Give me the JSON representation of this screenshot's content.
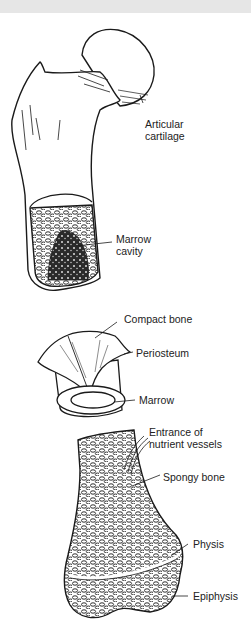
{
  "figure": {
    "sections": [
      {
        "id": "femur-head",
        "labels": [
          {
            "text": "Articular\ncartilage"
          },
          {
            "text": "Marrow\ncavity"
          }
        ]
      },
      {
        "id": "shaft-section",
        "labels": [
          {
            "text": "Compact bone"
          },
          {
            "text": "Periosteum"
          },
          {
            "text": "Marrow"
          }
        ]
      },
      {
        "id": "distal-end",
        "labels": [
          {
            "text": "Entrance of\nnutrient vessels"
          },
          {
            "text": "Spongy bone"
          },
          {
            "text": "Physis"
          },
          {
            "text": "Epiphysis"
          }
        ]
      }
    ]
  },
  "labels": {
    "articular_cartilage": "Articular\ncartilage",
    "marrow_cavity": "Marrow\ncavity",
    "compact_bone": "Compact bone",
    "periosteum": "Periosteum",
    "marrow": "Marrow",
    "nutrient_vessels": "Entrance of\nnutrient vessels",
    "spongy_bone": "Spongy bone",
    "physis": "Physis",
    "epiphysis": "Epiphysis"
  },
  "colors": {
    "topbar": "#e6e6e6",
    "ink": "#1a1a1a",
    "background": "#ffffff"
  }
}
